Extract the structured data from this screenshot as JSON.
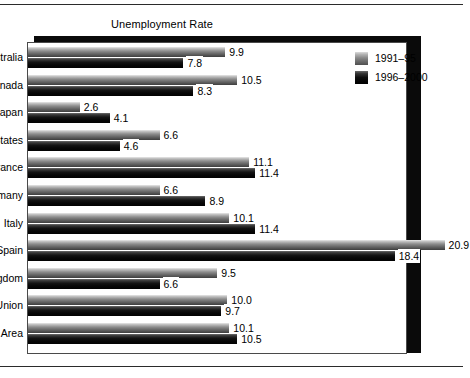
{
  "chart_data": {
    "type": "bar",
    "orientation": "horizontal",
    "title": "Unemployment Rate",
    "xlabel": "",
    "ylabel": "",
    "xlim": [
      0,
      22
    ],
    "grid": false,
    "legend_position": "top-right",
    "value_labels": true,
    "categories": [
      "Australia",
      "Canada",
      "Japan",
      "United States",
      "France",
      "Germany",
      "Italy",
      "Spain",
      "United Kingdom",
      "European Union",
      "Euro Area"
    ],
    "series": [
      {
        "name": "1991–95",
        "color": "#8d8d8d",
        "values": [
          9.9,
          10.5,
          2.6,
          6.6,
          11.1,
          6.6,
          10.1,
          20.9,
          9.5,
          10.0,
          10.1
        ],
        "labels": [
          "9.9",
          "10.5",
          "2.6",
          "6.6",
          "11.1",
          "6.6",
          "10.1",
          "20.9",
          "9.5",
          "10.0",
          "10.1"
        ]
      },
      {
        "name": "1996–2000",
        "color": "#0f0f0f",
        "values": [
          7.8,
          8.3,
          4.1,
          4.6,
          11.4,
          8.9,
          11.4,
          18.4,
          6.6,
          9.7,
          10.5
        ],
        "labels": [
          "7.8",
          "8.3",
          "4.1",
          "4.6",
          "11.4",
          "8.9",
          "11.4",
          "18.4",
          "6.6",
          "9.7",
          "10.5"
        ]
      }
    ]
  },
  "legend": {
    "items": [
      {
        "label": "1991–95"
      },
      {
        "label": "1996–2000"
      }
    ]
  }
}
